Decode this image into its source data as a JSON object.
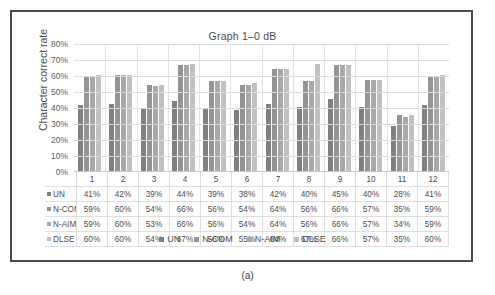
{
  "caption": "(a)",
  "chart_data": {
    "type": "bar",
    "title": "Graph 1–0 dB",
    "xlabel": "",
    "ylabel": "Character correct rate",
    "ylim": [
      0,
      80
    ],
    "ytick_labels": [
      "80%",
      "70%",
      "60%",
      "50%",
      "40%",
      "30%",
      "20%",
      "10%",
      "0%"
    ],
    "ytick_values": [
      80,
      70,
      60,
      50,
      40,
      30,
      20,
      10,
      0
    ],
    "grid": true,
    "legend_position": "bottom",
    "categories": [
      "1",
      "2",
      "3",
      "4",
      "5",
      "6",
      "7",
      "8",
      "9",
      "10",
      "11",
      "12"
    ],
    "series": [
      {
        "name": "UN",
        "color": "#808080",
        "values": [
          41,
          42,
          39,
          44,
          39,
          38,
          42,
          40,
          45,
          40,
          28,
          41
        ],
        "labels": [
          "41%",
          "42%",
          "39%",
          "44%",
          "39%",
          "38%",
          "42%",
          "40%",
          "45%",
          "40%",
          "28%",
          "41%"
        ]
      },
      {
        "name": "N-COM",
        "color": "#949494",
        "values": [
          59,
          60,
          54,
          66,
          56,
          54,
          64,
          56,
          66,
          57,
          35,
          59
        ],
        "labels": [
          "59%",
          "60%",
          "54%",
          "66%",
          "56%",
          "54%",
          "64%",
          "56%",
          "66%",
          "57%",
          "35%",
          "59%"
        ]
      },
      {
        "name": "N-AIM",
        "color": "#a8a8a8",
        "values": [
          59,
          60,
          53,
          66,
          56,
          54,
          64,
          56,
          66,
          57,
          34,
          59
        ],
        "labels": [
          "59%",
          "60%",
          "53%",
          "66%",
          "56%",
          "54%",
          "64%",
          "56%",
          "66%",
          "57%",
          "34%",
          "59%"
        ]
      },
      {
        "name": "DLSE",
        "color": "#c0c0c0",
        "values": [
          60,
          60,
          54,
          67,
          56,
          55,
          64,
          67,
          66,
          57,
          35,
          60
        ],
        "labels": [
          "60%",
          "60%",
          "54%",
          "67%",
          "56%",
          "55%",
          "64%",
          "67%",
          "66%",
          "57%",
          "35%",
          "60%"
        ]
      }
    ]
  }
}
